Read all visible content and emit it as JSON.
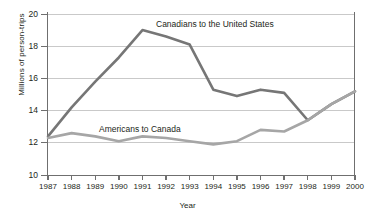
{
  "chart_data": {
    "type": "line",
    "title": "",
    "xlabel": "Year",
    "ylabel": "Millions of person-trips",
    "categories": [
      "1987",
      "1988",
      "1989",
      "1990",
      "1991",
      "1992",
      "1993",
      "1994",
      "1995",
      "1996",
      "1997",
      "1998",
      "1999",
      "2000"
    ],
    "xlim": [
      1987,
      2000
    ],
    "ylim": [
      10,
      20
    ],
    "yticks": [
      10,
      12,
      14,
      16,
      18,
      20
    ],
    "grid": true,
    "legend_position": "inline-annotation",
    "series": [
      {
        "name": "Canadians to the United States",
        "color": "#767676",
        "values": [
          12.4,
          14.2,
          15.8,
          17.3,
          19.0,
          18.6,
          18.1,
          15.3,
          14.9,
          15.3,
          15.1,
          13.4,
          14.4,
          15.2
        ]
      },
      {
        "name": "Americans to Canada",
        "color": "#a6a6a6",
        "values": [
          12.3,
          12.6,
          12.4,
          12.1,
          12.4,
          12.3,
          12.1,
          11.9,
          12.1,
          12.8,
          12.7,
          13.4,
          14.4,
          15.2
        ]
      }
    ],
    "annotations": [
      {
        "text": "Canadians to the United States",
        "series": "Canadians to the United States"
      },
      {
        "text": "Americans to Canada",
        "series": "Americans to Canada"
      }
    ]
  },
  "axis": {
    "y_title": "Millions of person-trips",
    "x_title": "Year",
    "y_tick_labels": [
      "20",
      "18",
      "16",
      "14",
      "12",
      "10"
    ],
    "x_tick_labels": [
      "1987",
      "1988",
      "1989",
      "1990",
      "1991",
      "1992",
      "1993",
      "1994",
      "1995",
      "1996",
      "1997",
      "1998",
      "1999",
      "2000"
    ]
  },
  "labels": {
    "canadians": "Canadians to the United States",
    "americans": "Americans to Canada"
  },
  "colors": {
    "canadians_line": "#767676",
    "americans_line": "#a6a6a6",
    "grid": "#c9c9c9",
    "axis": "#6f6f6f",
    "text": "#231f20",
    "background": "#ffffff"
  }
}
